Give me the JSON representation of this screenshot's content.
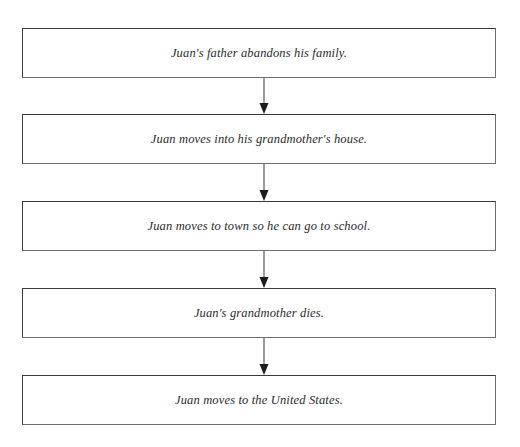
{
  "page": {
    "background_color": "#ffffff",
    "ghost_header_text": "",
    "width": 520,
    "height": 447
  },
  "diagram": {
    "type": "flowchart",
    "orientation": "vertical",
    "title": "",
    "box_style": {
      "fill": "#ffffff",
      "border_color": "#3a3a3a",
      "text_color": "#2b2b2b",
      "text_style": "italic-serif"
    },
    "connector_style": {
      "line_color": "#4a4a4a",
      "arrowhead_color": "#1c1c1c",
      "direction": "down"
    },
    "nodes": [
      {
        "id": "node-1",
        "label": "Juan's father abandons his family.",
        "x": 22,
        "y": 28,
        "width": 474,
        "height": 50
      },
      {
        "id": "node-2",
        "label": "Juan moves into his grandmother's house.",
        "x": 22,
        "y": 114,
        "width": 474,
        "height": 50
      },
      {
        "id": "node-3",
        "label": "Juan moves to town so he can go to school.",
        "x": 22,
        "y": 201,
        "width": 474,
        "height": 50
      },
      {
        "id": "node-4",
        "label": "Juan's grandmother dies.",
        "x": 22,
        "y": 288,
        "width": 474,
        "height": 50
      },
      {
        "id": "node-5",
        "label": "Juan moves to the United States.",
        "x": 22,
        "y": 375,
        "width": 474,
        "height": 50
      }
    ],
    "edges": [
      {
        "id": "edge-1-2",
        "from": "node-1",
        "to": "node-2",
        "x": 264,
        "y_start": 78,
        "y_end": 114
      },
      {
        "id": "edge-2-3",
        "from": "node-2",
        "to": "node-3",
        "x": 264,
        "y_start": 164,
        "y_end": 201
      },
      {
        "id": "edge-3-4",
        "from": "node-3",
        "to": "node-4",
        "x": 264,
        "y_start": 251,
        "y_end": 288
      },
      {
        "id": "edge-4-5",
        "from": "node-4",
        "to": "node-5",
        "x": 264,
        "y_start": 338,
        "y_end": 375
      }
    ]
  }
}
